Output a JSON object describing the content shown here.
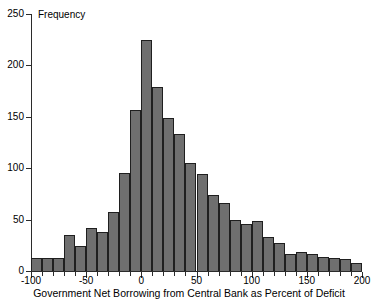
{
  "chart_data": {
    "type": "bar",
    "title": "",
    "subtitle": "",
    "xlabel": "Government Net Borrowing from Central Bank as Percent of Deficit",
    "ylabel": "Frequency",
    "legend": [],
    "grid": false,
    "xlim": [
      -100,
      200
    ],
    "ylim": [
      0,
      250
    ],
    "xticks": [
      -100,
      -50,
      0,
      50,
      100,
      150,
      200
    ],
    "xtick_labels": [
      "-100",
      "-50",
      "0",
      "50",
      "100",
      "150",
      "200"
    ],
    "xminor_tick_step": 10,
    "yticks": [
      0,
      50,
      100,
      150,
      200,
      250
    ],
    "ytick_labels": [
      "0",
      "50",
      "100",
      "150",
      "200",
      "250"
    ],
    "bin_width": 10,
    "bin_starts": [
      -100,
      -90,
      -80,
      -70,
      -60,
      -50,
      -40,
      -30,
      -20,
      -10,
      0,
      10,
      20,
      30,
      40,
      50,
      60,
      70,
      80,
      90,
      100,
      110,
      120,
      130,
      140,
      150,
      160,
      170,
      180,
      190
    ],
    "categories": [
      "-100 to -90",
      "-90 to -80",
      "-80 to -70",
      "-70 to -60",
      "-60 to -50",
      "-50 to -40",
      "-40 to -30",
      "-30 to -20",
      "-20 to -10",
      "-10 to 0",
      "0 to 10",
      "10 to 20",
      "20 to 30",
      "30 to 40",
      "40 to 50",
      "50 to 60",
      "60 to 70",
      "70 to 80",
      "80 to 90",
      "90 to 100",
      "100 to 110",
      "110 to 120",
      "120 to 130",
      "130 to 140",
      "140 to 150",
      "150 to 160",
      "160 to 170",
      "170 to 180",
      "180 to 190",
      "190 to 200"
    ],
    "values": [
      13,
      13,
      13,
      35,
      24,
      42,
      38,
      57,
      95,
      157,
      225,
      179,
      149,
      133,
      105,
      94,
      74,
      66,
      50,
      46,
      49,
      33,
      27,
      17,
      18,
      17,
      14,
      13,
      12,
      8
    ],
    "colors": {
      "bar_fill": "#6f6f6f",
      "bar_edge": "#1f1f1f",
      "axis": "#2b2b2b",
      "text": "#000000",
      "background": "#ffffff"
    }
  }
}
